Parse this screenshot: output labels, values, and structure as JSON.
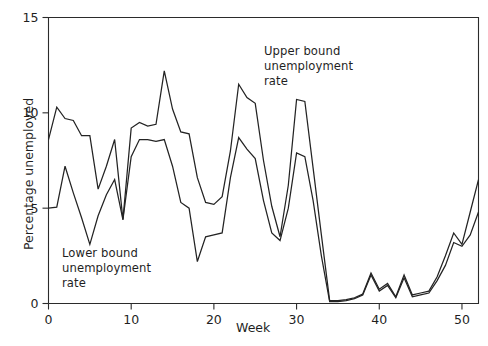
{
  "chart_data": {
    "type": "line",
    "title": "",
    "xlabel": "Week",
    "ylabel": "Percentage unemployed",
    "xlim": [
      0,
      52
    ],
    "ylim": [
      0,
      15
    ],
    "xticks": [
      0,
      10,
      20,
      30,
      40,
      50
    ],
    "yticks": [
      0,
      5,
      10,
      15
    ],
    "xtick_labels": [
      "0",
      "10",
      "20",
      "30",
      "40",
      "50"
    ],
    "ytick_labels": [
      "0",
      "5",
      "10",
      "15"
    ],
    "grid": false,
    "legend": "none",
    "line_color": "#232323",
    "frame_color": "#2b2b2b",
    "annotations": [
      {
        "name": "upper-bound-annotation",
        "text": "Upper bound\nunemployment\nrate",
        "x": 29.5,
        "y": 13.0
      },
      {
        "name": "lower-bound-annotation",
        "text": "Lower bound\nunemployment\nrate",
        "x": 2.0,
        "y": 3.2
      }
    ],
    "x": [
      0,
      1,
      2,
      3,
      4,
      5,
      6,
      7,
      8,
      9,
      10,
      11,
      12,
      13,
      14,
      15,
      16,
      17,
      18,
      19,
      20,
      21,
      22,
      23,
      24,
      25,
      26,
      27,
      28,
      29,
      30,
      31,
      32,
      33,
      34,
      35,
      36,
      37,
      38,
      39,
      40,
      41,
      42,
      43,
      44,
      45,
      46,
      47,
      48,
      49,
      50,
      51,
      52
    ],
    "series": [
      {
        "name": "Upper bound unemployment rate",
        "values": [
          8.6,
          10.3,
          9.7,
          9.6,
          8.8,
          8.8,
          6.0,
          7.2,
          8.6,
          4.4,
          9.2,
          9.5,
          9.3,
          9.4,
          12.2,
          10.2,
          9.0,
          8.9,
          6.6,
          5.3,
          5.2,
          5.6,
          8.0,
          11.5,
          10.8,
          10.5,
          7.5,
          5.1,
          3.5,
          6.2,
          10.7,
          10.6,
          7.1,
          3.6,
          0.15,
          0.15,
          0.2,
          0.3,
          0.5,
          1.6,
          0.75,
          1.05,
          0.35,
          1.5,
          0.45,
          0.55,
          0.65,
          1.4,
          2.5,
          3.7,
          3.1,
          4.8,
          6.5
        ]
      },
      {
        "name": "Lower bound unemployment rate",
        "values": [
          5.0,
          5.05,
          7.2,
          5.8,
          4.5,
          3.1,
          4.6,
          5.7,
          6.5,
          4.4,
          7.7,
          8.6,
          8.6,
          8.5,
          8.6,
          7.2,
          5.3,
          5.0,
          2.2,
          3.5,
          3.6,
          3.7,
          6.6,
          8.7,
          8.1,
          7.6,
          5.4,
          3.7,
          3.3,
          5.0,
          7.9,
          7.7,
          5.4,
          2.5,
          0.1,
          0.1,
          0.15,
          0.25,
          0.45,
          1.5,
          0.65,
          0.95,
          0.3,
          1.35,
          0.35,
          0.45,
          0.55,
          1.2,
          2.0,
          3.2,
          3.0,
          3.6,
          4.8
        ]
      }
    ]
  }
}
